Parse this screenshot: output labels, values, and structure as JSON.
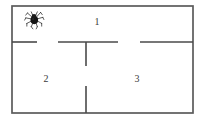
{
  "diagram": {
    "type": "floor-plan",
    "canvas": {
      "width": 209,
      "height": 125
    },
    "colors": {
      "wall": "#4a4a4a",
      "outer_wall": "#5b5b5b",
      "label": "#3a3a3a",
      "background": "#ffffff",
      "spider": "#1a1a1a"
    },
    "outer_boundary": {
      "x": 12,
      "y": 6,
      "width": 181,
      "height": 107
    },
    "rooms": [
      {
        "id": "room-1",
        "label": "1",
        "label_x": 97,
        "label_y": 22
      },
      {
        "id": "room-2",
        "label": "2",
        "label_x": 46,
        "label_y": 79
      },
      {
        "id": "room-3",
        "label": "3",
        "label_x": 137,
        "label_y": 79
      }
    ],
    "walls": [
      {
        "id": "wall-horizontal-left",
        "orientation": "horizontal",
        "x1": 12,
        "y1": 42,
        "x2": 37,
        "y2": 42
      },
      {
        "id": "wall-horizontal-middle",
        "orientation": "horizontal",
        "x1": 58,
        "y1": 42,
        "x2": 118,
        "y2": 42
      },
      {
        "id": "wall-horizontal-right",
        "orientation": "horizontal",
        "x1": 140,
        "y1": 42,
        "x2": 193,
        "y2": 42
      },
      {
        "id": "wall-vertical-upper",
        "orientation": "vertical",
        "x1": 86,
        "y1": 42,
        "x2": 86,
        "y2": 66
      },
      {
        "id": "wall-vertical-lower",
        "orientation": "vertical",
        "x1": 86,
        "y1": 86,
        "x2": 86,
        "y2": 113
      }
    ],
    "doorways": [
      {
        "id": "doorway-top-left",
        "x1": 37,
        "y1": 42,
        "x2": 58,
        "y2": 42
      },
      {
        "id": "doorway-top-right",
        "x1": 118,
        "y1": 42,
        "x2": 140,
        "y2": 42
      },
      {
        "id": "doorway-vertical",
        "x1": 86,
        "y1": 66,
        "x2": 86,
        "y2": 86
      }
    ],
    "icons": [
      {
        "id": "spider",
        "name": "spider-icon",
        "x": 34,
        "y": 19,
        "size": 22,
        "room": "room-1"
      }
    ]
  }
}
